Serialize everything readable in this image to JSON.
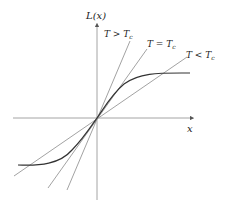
{
  "diagram": {
    "axes": {
      "y_label": "L(x)",
      "x_label": "x",
      "color": "#9a9a9a"
    },
    "lines": [
      {
        "id": "above-tc",
        "label_main": "T > T",
        "label_sub": "c",
        "color": "#8a8a8a"
      },
      {
        "id": "at-tc",
        "label_main": "T = T",
        "label_sub": "c",
        "color": "#8a8a8a"
      },
      {
        "id": "below-tc",
        "label_main": "T < T",
        "label_sub": "c",
        "color": "#8a8a8a"
      }
    ],
    "curve": {
      "name": "L(x) sigmoid",
      "color": "#333333"
    }
  }
}
